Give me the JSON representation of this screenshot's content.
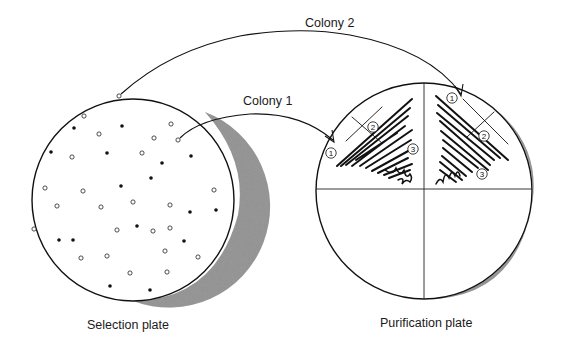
{
  "diagram": {
    "labels": {
      "colony_1": "Colony 1",
      "colony_2": "Colony 2",
      "selection_plate": "Selection plate",
      "purification_plate": "Purification plate"
    },
    "streak_markers": [
      "1",
      "2",
      "3"
    ],
    "colors": {
      "line": "#111111",
      "shadow": "#8c8c8c",
      "background": "#ffffff"
    },
    "selection_plate": {
      "cx": 133,
      "cy": 200,
      "r": 101,
      "open_colonies": [
        [
          119,
          96
        ],
        [
          84,
          116
        ],
        [
          99,
          134
        ],
        [
          171,
          124
        ],
        [
          154,
          138
        ],
        [
          178,
          140
        ],
        [
          72,
          157
        ],
        [
          142,
          153
        ],
        [
          45,
          188
        ],
        [
          83,
          191
        ],
        [
          133,
          202
        ],
        [
          170,
          205
        ],
        [
          57,
          206
        ],
        [
          101,
          207
        ],
        [
          170,
          228
        ],
        [
          214,
          190
        ],
        [
          34,
          229
        ],
        [
          117,
          230
        ],
        [
          153,
          231
        ],
        [
          107,
          256
        ],
        [
          165,
          251
        ],
        [
          81,
          258
        ],
        [
          198,
          257
        ],
        [
          130,
          273
        ],
        [
          167,
          272
        ]
      ],
      "filled_colonies": [
        [
          149,
          103
        ],
        [
          74,
          128
        ],
        [
          122,
          126
        ],
        [
          51,
          152
        ],
        [
          107,
          153
        ],
        [
          162,
          163
        ],
        [
          191,
          156
        ],
        [
          151,
          178
        ],
        [
          121,
          186
        ],
        [
          190,
          212
        ],
        [
          216,
          210
        ],
        [
          59,
          240
        ],
        [
          137,
          226
        ],
        [
          184,
          241
        ],
        [
          110,
          286
        ],
        [
          150,
          290
        ],
        [
          73,
          240
        ],
        [
          14,
          48
        ]
      ]
    },
    "purification_plate": {
      "cx": 424,
      "cy": 191,
      "r": 108,
      "divider_x": 424,
      "divider_y": 189
    },
    "arrows": [
      {
        "name": "colony-2-arrow",
        "from": [
          119,
          96
        ],
        "to": [
          461,
          95
        ]
      },
      {
        "name": "colony-1-arrow",
        "from": [
          178,
          140
        ],
        "to": [
          333,
          140
        ]
      }
    ]
  }
}
